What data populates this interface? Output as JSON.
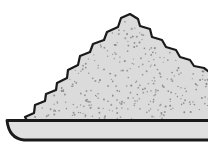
{
  "figure": {
    "background_color": "#ffffff",
    "outline_color": "#1a1a1a",
    "pile": {
      "fill_color": "#dbdbdb",
      "stroke_width": 2.2,
      "outline_points": [
        [
          29,
          124
        ],
        [
          25,
          117
        ],
        [
          34,
          113
        ],
        [
          35,
          105
        ],
        [
          45,
          101
        ],
        [
          46,
          94
        ],
        [
          56,
          90
        ],
        [
          57,
          83
        ],
        [
          67,
          78
        ],
        [
          68,
          70
        ],
        [
          78,
          65
        ],
        [
          80,
          56
        ],
        [
          90,
          52
        ],
        [
          93,
          44
        ],
        [
          104,
          40
        ],
        [
          107,
          32
        ],
        [
          118,
          27
        ],
        [
          121,
          18
        ],
        [
          130,
          14
        ],
        [
          138,
          19
        ],
        [
          140,
          26
        ],
        [
          150,
          29
        ],
        [
          152,
          37
        ],
        [
          162,
          40
        ],
        [
          166,
          47
        ],
        [
          176,
          50
        ],
        [
          180,
          57
        ],
        [
          190,
          60
        ],
        [
          194,
          66
        ],
        [
          204,
          68
        ],
        [
          212,
          74
        ],
        [
          212,
          124
        ]
      ]
    },
    "tray": {
      "fill_color": "#e0e0e0",
      "stroke_width": 2.8,
      "path": "M 7 120.5 L 212 120.5 L 212 140 L 24 140 Q 9 138.5 7 120.5 Z"
    },
    "speckles": {
      "count": 300,
      "seed": 12,
      "color": "#878787",
      "min_radius": 0.6,
      "max_radius": 1.05,
      "edge_margin": 3.5,
      "max_y": 118.5
    }
  }
}
